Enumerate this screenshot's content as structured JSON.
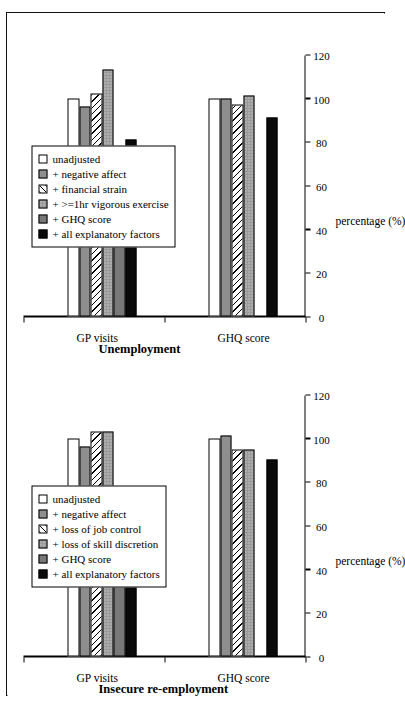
{
  "figure": {
    "background": "#ffffff",
    "border_color": "#111111"
  },
  "axis": {
    "y_title": "percentage (%)",
    "ticks": [
      "120",
      "100",
      "80",
      "60",
      "40",
      "20",
      "0"
    ],
    "tick_values": [
      120,
      100,
      80,
      60,
      40,
      20,
      0
    ]
  },
  "panels": [
    {
      "id": "unemployment",
      "title": "Unemployment",
      "categories": [
        "GHQ score",
        "GP visits"
      ],
      "legend": [
        {
          "label": "unadjusted",
          "fill": "white"
        },
        {
          "label": "+ negative affect",
          "fill": "gray"
        },
        {
          "label": "+ financial strain",
          "fill": "hatch"
        },
        {
          "label": "+ >=1hr vigorous exercise",
          "fill": "dot"
        },
        {
          "label": "+ GHQ score",
          "fill": "darkgray"
        },
        {
          "label": "+ all explanatory factors",
          "fill": "black"
        }
      ]
    },
    {
      "id": "insecure",
      "title": "Insecure re-employment",
      "categories": [
        "GHQ score",
        "GP visits"
      ],
      "legend": [
        {
          "label": "unadjusted",
          "fill": "white"
        },
        {
          "label": "+ negative affect",
          "fill": "gray"
        },
        {
          "label": "+ loss of job control",
          "fill": "hatch"
        },
        {
          "label": "+ loss of skill discretion",
          "fill": "dot"
        },
        {
          "label": "+ GHQ score",
          "fill": "darkgray"
        },
        {
          "label": "+ all explanatory factors",
          "fill": "black"
        }
      ]
    }
  ],
  "chart_data": [
    {
      "type": "bar",
      "orientation": "horizontal",
      "title": "Unemployment",
      "xlabel": "",
      "ylabel": "percentage (%)",
      "ylim": [
        0,
        120
      ],
      "grid": false,
      "legend_position": "upper-left",
      "categories": [
        "GHQ score",
        "GP visits"
      ],
      "series": [
        {
          "name": "unadjusted",
          "fill": "white",
          "values": [
            100,
            100
          ]
        },
        {
          "name": "+ negative affect",
          "fill": "gray",
          "values": [
            100,
            96
          ]
        },
        {
          "name": "+ financial strain",
          "fill": "hatch",
          "values": [
            97,
            102
          ]
        },
        {
          "name": "+ >=1hr vigorous exercise",
          "fill": "dot",
          "values": [
            101,
            113
          ]
        },
        {
          "name": "+ GHQ score",
          "fill": "darkgray",
          "values": [
            0,
            75
          ]
        },
        {
          "name": "+ all explanatory factors",
          "fill": "black",
          "values": [
            91,
            81
          ]
        }
      ]
    },
    {
      "type": "bar",
      "orientation": "horizontal",
      "title": "Insecure re-employment",
      "xlabel": "",
      "ylabel": "percentage (%)",
      "ylim": [
        0,
        120
      ],
      "grid": false,
      "legend_position": "upper-left",
      "categories": [
        "GHQ score",
        "GP visits"
      ],
      "series": [
        {
          "name": "unadjusted",
          "fill": "white",
          "values": [
            100,
            100
          ]
        },
        {
          "name": "+ negative affect",
          "fill": "gray",
          "values": [
            101,
            96
          ]
        },
        {
          "name": "+ loss of job control",
          "fill": "hatch",
          "values": [
            95,
            103
          ]
        },
        {
          "name": "+ loss of skill discretion",
          "fill": "dot",
          "values": [
            95,
            103
          ]
        },
        {
          "name": "+ GHQ score",
          "fill": "darkgray",
          "values": [
            0,
            75
          ]
        },
        {
          "name": "+ all explanatory factors",
          "fill": "black",
          "values": [
            90,
            78
          ]
        }
      ]
    }
  ]
}
